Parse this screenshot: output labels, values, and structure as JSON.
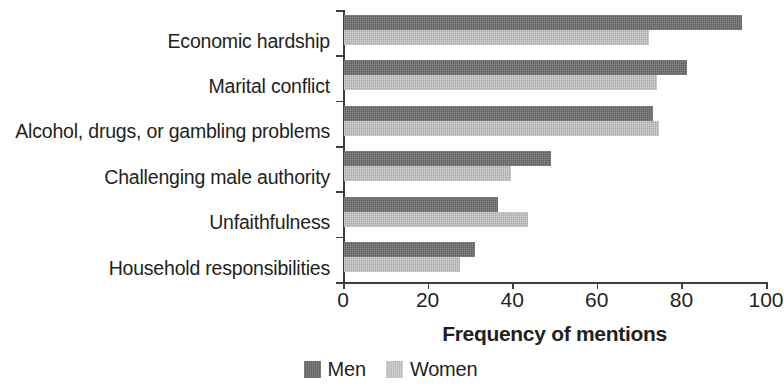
{
  "chart_data": {
    "type": "bar",
    "orientation": "horizontal",
    "title": "",
    "subtitle": "",
    "xlabel": "Frequency of mentions",
    "ylabel": "",
    "xlim": [
      0,
      100
    ],
    "xticks": [
      0,
      20,
      40,
      60,
      80,
      100
    ],
    "xtick_labels": [
      "0",
      "20",
      "40",
      "60",
      "80",
      "100"
    ],
    "grid": false,
    "legend_position": "bottom-center",
    "categories": [
      "Economic hardship",
      "Marital conflict",
      "Alcohol, drugs, or gambling problems",
      "Challenging male authority",
      "Unfaithfulness",
      "Household responsibilities"
    ],
    "series": [
      {
        "name": "Men",
        "color": "#6d6d6d",
        "values": [
          94,
          81,
          73,
          49,
          36.5,
          31
        ]
      },
      {
        "name": "Women",
        "color": "#bfbfbf",
        "values": [
          72,
          74,
          74.5,
          39.5,
          43.5,
          27.5
        ]
      }
    ]
  },
  "legend": {
    "items": [
      {
        "label": "Men",
        "swatch": "men-swatch"
      },
      {
        "label": "Women",
        "swatch": "women-swatch"
      }
    ]
  },
  "axis": {
    "x_title": "Frequency of mentions"
  }
}
